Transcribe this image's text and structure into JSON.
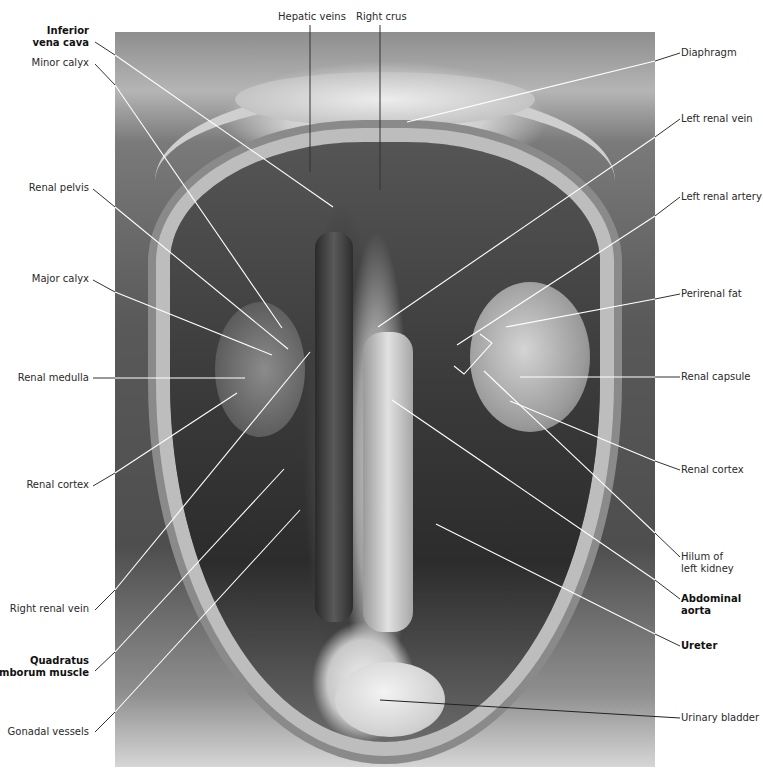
{
  "figure": {
    "type": "anatomical-photograph",
    "colors": {
      "label_text": "#2a2a2a",
      "leader_line_on_photo": "#ffffff",
      "leader_line_on_white": "#333333",
      "background": "#ffffff"
    }
  },
  "labels": {
    "top": [
      {
        "id": "hepatic-veins",
        "text": "Hepatic veins",
        "bold": false
      },
      {
        "id": "right-crus",
        "text": "Right crus",
        "bold": false
      }
    ],
    "left": [
      {
        "id": "inferior-vena-cava",
        "lines": [
          "Inferior",
          "vena cava"
        ],
        "bold": true
      },
      {
        "id": "minor-calyx",
        "text": "Minor calyx",
        "bold": false
      },
      {
        "id": "renal-pelvis",
        "text": "Renal pelvis",
        "bold": false
      },
      {
        "id": "major-calyx",
        "text": "Major calyx",
        "bold": false
      },
      {
        "id": "renal-medulla",
        "text": "Renal medulla",
        "bold": false
      },
      {
        "id": "renal-cortex-right",
        "text": "Renal cortex",
        "bold": false
      },
      {
        "id": "right-renal-vein",
        "text": "Right renal vein",
        "bold": false
      },
      {
        "id": "quadratus-lumborum",
        "lines": [
          "Quadratus",
          "lumborum muscle"
        ],
        "bold": true
      },
      {
        "id": "gonadal-vessels",
        "text": "Gonadal vessels",
        "bold": false
      }
    ],
    "right": [
      {
        "id": "diaphragm",
        "text": "Diaphragm",
        "bold": false
      },
      {
        "id": "left-renal-vein",
        "text": "Left renal vein",
        "bold": false
      },
      {
        "id": "left-renal-artery",
        "text": "Left renal artery",
        "bold": false
      },
      {
        "id": "perirenal-fat",
        "text": "Perirenal fat",
        "bold": false
      },
      {
        "id": "renal-capsule",
        "text": "Renal capsule",
        "bold": false
      },
      {
        "id": "renal-cortex-left",
        "text": "Renal cortex",
        "bold": false
      },
      {
        "id": "hilum-left-kidney",
        "lines": [
          "Hilum of",
          "left kidney"
        ],
        "bold": false
      },
      {
        "id": "abdominal-aorta",
        "lines": [
          "Abdominal",
          "aorta"
        ],
        "bold": true
      },
      {
        "id": "ureter",
        "text": "Ureter",
        "bold": false,
        "bold_note": "rendered bold",
        "bold_rendered": true
      },
      {
        "id": "urinary-bladder",
        "text": "Urinary bladder",
        "bold": false
      }
    ]
  }
}
